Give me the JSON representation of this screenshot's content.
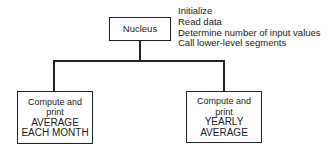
{
  "diagram": {
    "type": "structure-chart",
    "root": {
      "label": "Nucleus",
      "notes": [
        "Initialize",
        "Read data",
        "Determine number of input values",
        "Call lower-level segments"
      ]
    },
    "children": [
      {
        "lines": [
          "Compute and",
          "print",
          "AVERAGE",
          "EACH MONTH"
        ]
      },
      {
        "lines": [
          "Compute and",
          "print",
          "YEARLY",
          "AVERAGE"
        ]
      }
    ],
    "colors": {
      "line": "#222222",
      "background": "#ffffff",
      "text": "#1a1a1a"
    }
  }
}
